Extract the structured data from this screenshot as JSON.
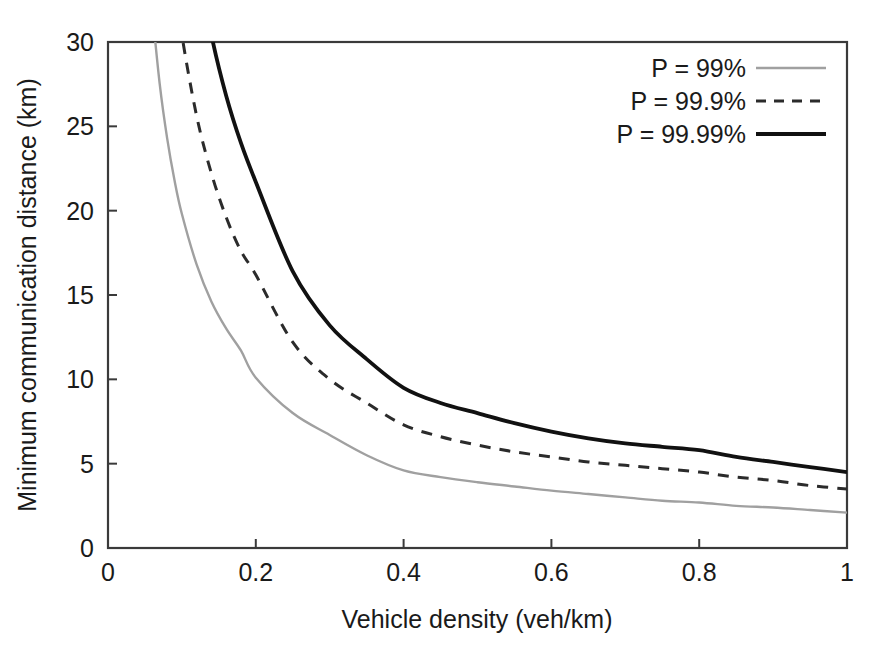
{
  "figure": {
    "background_color": "#ffffff",
    "frame_color": "#3a3a3a"
  },
  "chart_data": {
    "type": "line",
    "title": "",
    "xlabel": "Vehicle density (veh/km)",
    "ylabel": "Minimum communication distance (km)",
    "xlim": [
      0,
      1
    ],
    "ylim": [
      0,
      30
    ],
    "xticks": [
      0,
      0.2,
      0.4,
      0.6,
      0.8,
      1
    ],
    "xticklabels": [
      "0",
      "0.2",
      "0.4",
      "0.6",
      "0.8",
      "1"
    ],
    "yticks": [
      0,
      5,
      10,
      15,
      20,
      25,
      30
    ],
    "yticklabels": [
      "0",
      "5",
      "10",
      "15",
      "20",
      "25",
      "30"
    ],
    "grid": false,
    "legend_position": "top-right",
    "x": [
      0.06,
      0.07,
      0.08,
      0.09,
      0.1,
      0.12,
      0.14,
      0.16,
      0.18,
      0.2,
      0.25,
      0.3,
      0.35,
      0.4,
      0.45,
      0.5,
      0.55,
      0.6,
      0.65,
      0.7,
      0.75,
      0.8,
      0.85,
      0.9,
      0.95,
      1.0
    ],
    "series": [
      {
        "name": "P = 99%",
        "color": "#a0a0a0",
        "style": "solid",
        "width": 2.4,
        "values": [
          31.8,
          27.5,
          24.3,
          21.8,
          19.8,
          16.8,
          14.6,
          13.0,
          11.7,
          10.1,
          8.0,
          6.7,
          5.5,
          4.6,
          4.2,
          3.9,
          3.65,
          3.4,
          3.2,
          3.0,
          2.8,
          2.7,
          2.5,
          2.4,
          2.25,
          2.1
        ]
      },
      {
        "name": "P = 99.9%",
        "color": "#2b2b2b",
        "style": "dashed",
        "width": 3.0,
        "values": [
          50.0,
          43.0,
          38.0,
          33.8,
          30.4,
          25.6,
          22.2,
          19.6,
          17.6,
          16.2,
          12.2,
          10.0,
          8.6,
          7.3,
          6.6,
          6.1,
          5.7,
          5.4,
          5.1,
          4.9,
          4.7,
          4.5,
          4.2,
          4.0,
          3.7,
          3.5
        ]
      },
      {
        "name": "P = 99.99%",
        "color": "#111111",
        "style": "solid",
        "width": 3.8,
        "values": [
          68.0,
          59.0,
          52.0,
          46.5,
          42.0,
          35.2,
          30.4,
          26.8,
          24.0,
          21.7,
          16.4,
          13.2,
          11.2,
          9.5,
          8.6,
          8.0,
          7.4,
          6.9,
          6.5,
          6.2,
          6.0,
          5.8,
          5.4,
          5.1,
          4.8,
          4.5
        ]
      }
    ]
  },
  "legend": {
    "entries": [
      {
        "label": "P = 99%"
      },
      {
        "label": "P = 99.9%"
      },
      {
        "label": "P = 99.99%"
      }
    ]
  }
}
